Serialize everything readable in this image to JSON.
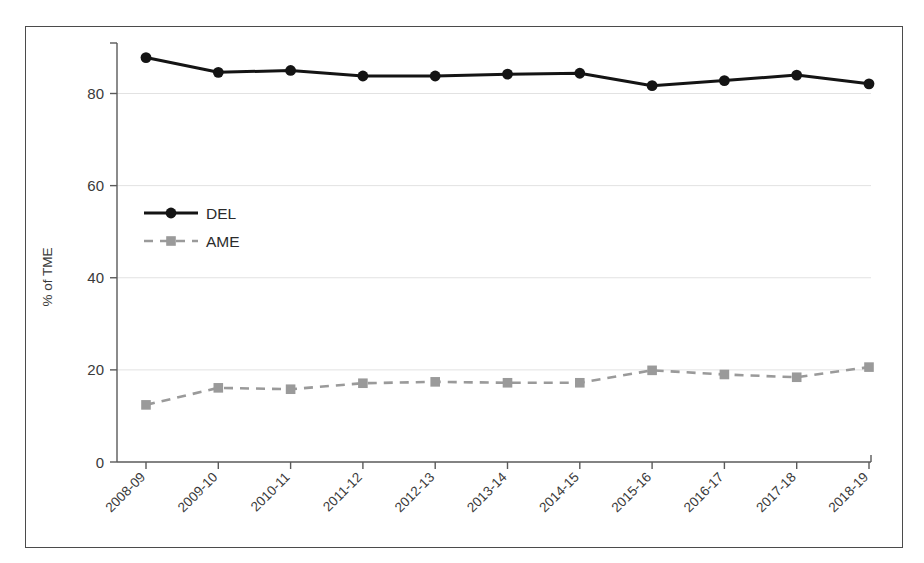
{
  "chart_data": {
    "type": "line",
    "title": "",
    "xlabel": "",
    "ylabel": "% of TME",
    "ylim": [
      0,
      90
    ],
    "yticks": [
      0,
      20,
      40,
      60,
      80
    ],
    "ytick_labels": [
      "0",
      "20",
      "40",
      "60",
      "80"
    ],
    "grid": true,
    "grid_axis": "y",
    "legend_position": "inside-left",
    "categories": [
      "2008-09",
      "2009-10",
      "2010-11",
      "2011-12",
      "2012-13",
      "2013-14",
      "2014-15",
      "2015-16",
      "2016-17",
      "2017-18",
      "2018-19"
    ],
    "series": [
      {
        "name": "DEL",
        "color": "#141414",
        "line_style": "solid",
        "marker": "circle",
        "values": [
          87.8,
          84.6,
          85.0,
          83.8,
          83.8,
          84.2,
          84.4,
          81.7,
          82.8,
          84.0,
          82.1
        ]
      },
      {
        "name": "AME",
        "color": "#9a9a9a",
        "line_style": "dashed",
        "marker": "square",
        "values": [
          12.4,
          16.1,
          15.8,
          17.1,
          17.4,
          17.2,
          17.2,
          19.9,
          19.0,
          18.4,
          20.6
        ]
      }
    ]
  },
  "legend": {
    "items": [
      {
        "label": "DEL",
        "color": "#141414",
        "marker": "circle",
        "line_style": "solid"
      },
      {
        "label": "AME",
        "color": "#9a9a9a",
        "marker": "square",
        "line_style": "dashed"
      }
    ]
  },
  "axes": {
    "y_axis_title": "% of TME"
  }
}
